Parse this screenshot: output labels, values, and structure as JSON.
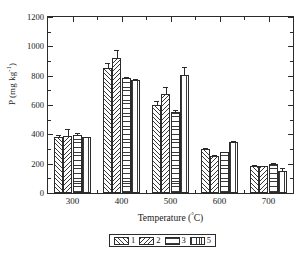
{
  "chart_data": {
    "type": "bar",
    "title": "",
    "xlabel": "Temperature (°C)",
    "ylabel": "P (mg·kg⁻¹)",
    "ylabel_main": "P (mg kg",
    "ylabel_sup": "-1",
    "ylabel_tail": ")",
    "xlabel_main": "Temperature (",
    "xlabel_deg": "°",
    "xlabel_tail": "C)",
    "categories": [
      "300",
      "400",
      "500",
      "600",
      "700"
    ],
    "ylim": [
      0,
      1200
    ],
    "yticks": [
      0,
      200,
      400,
      600,
      800,
      1000,
      1200
    ],
    "ytick_labels": [
      "0",
      "200",
      "400",
      "600",
      "800",
      "1000",
      "1200"
    ],
    "grid": false,
    "legend_position": "bottom-outside",
    "series": [
      {
        "name": "1",
        "pattern": "diagonal-forward",
        "values": [
          380,
          850,
          600,
          300,
          185
        ],
        "errors": [
          15,
          35,
          30,
          8,
          8
        ]
      },
      {
        "name": "2",
        "pattern": "diagonal-back",
        "values": [
          390,
          920,
          675,
          250,
          182
        ],
        "errors": [
          45,
          55,
          45,
          6,
          5
        ]
      },
      {
        "name": "3",
        "pattern": "horizontal",
        "values": [
          395,
          785,
          553,
          277,
          198
        ],
        "errors": [
          14,
          6,
          10,
          5,
          5
        ]
      },
      {
        "name": "5",
        "pattern": "vertical",
        "values": [
          380,
          770,
          805,
          350,
          150
        ],
        "errors": [
          4,
          8,
          55,
          5,
          18
        ]
      }
    ]
  },
  "legend": {
    "entries": [
      {
        "label": "1",
        "pattern": "diagonal-forward"
      },
      {
        "label": "2",
        "pattern": "diagonal-back"
      },
      {
        "label": "3",
        "pattern": "horizontal"
      },
      {
        "label": "5",
        "pattern": "vertical"
      }
    ]
  },
  "colors": {
    "axis": "#2b2b2b",
    "hatch": "#3a3a3a",
    "background": "#ffffff"
  }
}
